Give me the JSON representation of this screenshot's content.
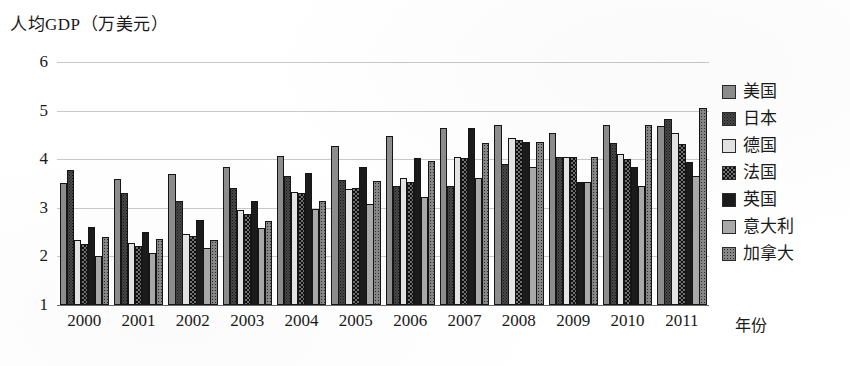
{
  "chart_data": {
    "type": "bar",
    "title": "人均GDP（万美元）",
    "xlabel": "年份",
    "ylabel": "人均GDP（万美元）",
    "ylim": [
      1,
      6
    ],
    "yticks": [
      1,
      2,
      3,
      4,
      5,
      6
    ],
    "grid": true,
    "legend_position": "right",
    "categories": [
      "2000",
      "2001",
      "2002",
      "2003",
      "2004",
      "2005",
      "2006",
      "2007",
      "2008",
      "2009",
      "2010",
      "2011"
    ],
    "series": [
      {
        "name": "美国",
        "pattern": "solid-grey",
        "values": [
          3.52,
          3.59,
          3.7,
          3.85,
          4.06,
          4.28,
          4.47,
          4.65,
          4.7,
          4.53,
          4.7,
          4.68
        ]
      },
      {
        "name": "日本",
        "pattern": "dark-dotted",
        "values": [
          3.77,
          3.3,
          3.14,
          3.4,
          3.65,
          3.58,
          3.45,
          3.45,
          3.9,
          4.05,
          4.33,
          4.82
        ]
      },
      {
        "name": "德国",
        "pattern": "light-plain",
        "values": [
          2.33,
          2.28,
          2.47,
          2.95,
          3.33,
          3.38,
          3.61,
          4.05,
          4.43,
          4.05,
          4.11,
          4.53
        ]
      },
      {
        "name": "法国",
        "pattern": "checker-speckle",
        "values": [
          2.25,
          2.22,
          2.42,
          2.88,
          3.3,
          3.41,
          3.53,
          4.03,
          4.4,
          4.05,
          4.0,
          4.32
        ]
      },
      {
        "name": "英国",
        "pattern": "solid-black",
        "values": [
          2.6,
          2.5,
          2.75,
          3.14,
          3.72,
          3.83,
          4.03,
          4.65,
          4.35,
          3.53,
          3.85,
          3.95
        ]
      },
      {
        "name": "意大利",
        "pattern": "mid-grey",
        "values": [
          2.0,
          2.08,
          2.18,
          2.58,
          2.98,
          3.07,
          3.23,
          3.62,
          3.83,
          3.53,
          3.45,
          3.65
        ]
      },
      {
        "name": "加拿大",
        "pattern": "grey-dotted",
        "values": [
          2.4,
          2.35,
          2.33,
          2.72,
          3.13,
          3.55,
          3.97,
          4.33,
          4.35,
          4.05,
          4.7,
          5.05
        ]
      }
    ]
  },
  "legend": {
    "items": [
      {
        "label": "美国"
      },
      {
        "label": "日本"
      },
      {
        "label": "德国"
      },
      {
        "label": "法国"
      },
      {
        "label": "英国"
      },
      {
        "label": "意大利"
      },
      {
        "label": "加拿大"
      }
    ]
  },
  "colors": {
    "gridline": "#c9c9c9",
    "axis": "#6b6b6b",
    "text": "#1a1a1a",
    "series": [
      "#8d8d8d",
      "#4a4a4a",
      "#e4e4e4",
      "#6f6f6f",
      "#1b1b1b",
      "#a9a9a9",
      "#878787"
    ]
  }
}
